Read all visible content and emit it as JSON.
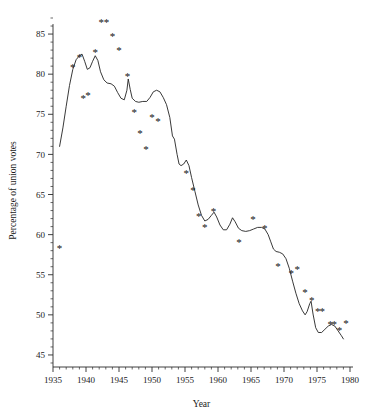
{
  "chart_data": {
    "type": "scatter",
    "title": "",
    "xlabel": "Year",
    "ylabel": "Percentage of union votes",
    "xlim": [
      1935,
      1980
    ],
    "ylim": [
      43.5,
      87.5
    ],
    "grid": false,
    "legend": "none",
    "x_ticks": [
      1935,
      1940,
      1945,
      1950,
      1955,
      1960,
      1965,
      1970,
      1975,
      1980
    ],
    "x_tick_labels": [
      "1935",
      "1940",
      "1945",
      "1950",
      "1955",
      "1960",
      "1965",
      "1970",
      "1975",
      "1980"
    ],
    "x_minor_step": 1,
    "y_ticks": [
      45,
      50,
      55,
      60,
      65,
      70,
      75,
      80,
      85
    ],
    "y_tick_labels": [
      "45",
      "50",
      "55",
      "60",
      "65",
      "70",
      "75",
      "80",
      "85"
    ],
    "y_minor_step": 1,
    "marker_symbol": "*",
    "series": [
      {
        "name": "observed",
        "type": "scatter",
        "marker": "*",
        "points": [
          [
            1936,
            58.2
          ],
          [
            1938,
            80.8
          ],
          [
            1939,
            82.0
          ],
          [
            1939.6,
            76.9
          ],
          [
            1940.3,
            77.3
          ],
          [
            1941.4,
            82.6
          ],
          [
            1942.3,
            86.4
          ],
          [
            1943.1,
            86.4
          ],
          [
            1944.0,
            84.6
          ],
          [
            1945.0,
            82.9
          ],
          [
            1946.3,
            79.6
          ],
          [
            1947.3,
            75.2
          ],
          [
            1948.2,
            72.5
          ],
          [
            1949.1,
            70.5
          ],
          [
            1950.0,
            74.5
          ],
          [
            1950.9,
            74.1
          ],
          [
            1955.2,
            67.6
          ],
          [
            1956.2,
            65.4
          ],
          [
            1957.1,
            62.2
          ],
          [
            1958.0,
            60.8
          ],
          [
            1959.3,
            62.8
          ],
          [
            1963.2,
            59.0
          ],
          [
            1965.3,
            61.8
          ],
          [
            1967.1,
            60.7
          ],
          [
            1969.1,
            56.0
          ],
          [
            1971.1,
            55.1
          ],
          [
            1972.0,
            55.6
          ],
          [
            1973.2,
            52.7
          ],
          [
            1974.2,
            51.7
          ],
          [
            1975.1,
            50.4
          ],
          [
            1975.8,
            50.4
          ],
          [
            1977.0,
            48.8
          ],
          [
            1977.6,
            48.8
          ],
          [
            1978.4,
            48.0
          ],
          [
            1979.4,
            48.9
          ]
        ]
      },
      {
        "name": "smoothed-trend",
        "type": "line",
        "points": [
          [
            1936.0,
            71.0
          ],
          [
            1936.5,
            73.3
          ],
          [
            1937.0,
            76.0
          ],
          [
            1937.5,
            78.6
          ],
          [
            1938.0,
            80.6
          ],
          [
            1938.5,
            81.8
          ],
          [
            1939.0,
            82.3
          ],
          [
            1939.4,
            82.5
          ],
          [
            1939.8,
            81.6
          ],
          [
            1940.2,
            80.6
          ],
          [
            1940.6,
            80.8
          ],
          [
            1941.0,
            81.6
          ],
          [
            1941.4,
            82.3
          ],
          [
            1941.8,
            81.7
          ],
          [
            1942.2,
            80.3
          ],
          [
            1942.7,
            79.3
          ],
          [
            1943.2,
            78.9
          ],
          [
            1943.8,
            78.8
          ],
          [
            1944.3,
            78.5
          ],
          [
            1944.8,
            77.7
          ],
          [
            1945.3,
            77.0
          ],
          [
            1945.8,
            76.8
          ],
          [
            1946.2,
            78.0
          ],
          [
            1946.4,
            79.4
          ],
          [
            1946.7,
            78.1
          ],
          [
            1947.0,
            77.0
          ],
          [
            1947.5,
            76.6
          ],
          [
            1948.0,
            76.5
          ],
          [
            1948.6,
            76.6
          ],
          [
            1949.2,
            76.6
          ],
          [
            1949.7,
            77.1
          ],
          [
            1950.2,
            77.8
          ],
          [
            1950.7,
            78.0
          ],
          [
            1951.2,
            77.8
          ],
          [
            1951.7,
            77.1
          ],
          [
            1952.2,
            76.2
          ],
          [
            1952.7,
            74.6
          ],
          [
            1953.1,
            72.3
          ],
          [
            1953.4,
            71.9
          ],
          [
            1953.8,
            70.0
          ],
          [
            1954.1,
            68.8
          ],
          [
            1954.4,
            68.6
          ],
          [
            1954.8,
            68.8
          ],
          [
            1955.2,
            69.3
          ],
          [
            1955.6,
            68.6
          ],
          [
            1956.0,
            67.1
          ],
          [
            1956.5,
            65.4
          ],
          [
            1957.0,
            63.7
          ],
          [
            1957.5,
            62.4
          ],
          [
            1958.0,
            61.7
          ],
          [
            1958.5,
            61.9
          ],
          [
            1959.0,
            62.4
          ],
          [
            1959.4,
            62.8
          ],
          [
            1959.8,
            62.2
          ],
          [
            1960.3,
            61.2
          ],
          [
            1960.8,
            60.6
          ],
          [
            1961.3,
            60.6
          ],
          [
            1961.8,
            61.3
          ],
          [
            1962.2,
            62.1
          ],
          [
            1962.6,
            61.6
          ],
          [
            1963.1,
            60.8
          ],
          [
            1963.6,
            60.5
          ],
          [
            1964.2,
            60.4
          ],
          [
            1964.8,
            60.5
          ],
          [
            1965.4,
            60.7
          ],
          [
            1966.0,
            60.9
          ],
          [
            1966.6,
            60.9
          ],
          [
            1967.1,
            60.7
          ],
          [
            1967.6,
            60.0
          ],
          [
            1968.0,
            59.1
          ],
          [
            1968.4,
            58.2
          ],
          [
            1968.8,
            57.9
          ],
          [
            1969.3,
            57.8
          ],
          [
            1969.8,
            57.6
          ],
          [
            1970.3,
            57.0
          ],
          [
            1970.8,
            55.8
          ],
          [
            1971.3,
            54.2
          ],
          [
            1971.8,
            52.7
          ],
          [
            1972.3,
            51.4
          ],
          [
            1972.8,
            50.5
          ],
          [
            1973.2,
            50.0
          ],
          [
            1973.5,
            50.4
          ],
          [
            1973.9,
            51.4
          ],
          [
            1974.1,
            51.7
          ],
          [
            1974.4,
            50.1
          ],
          [
            1974.8,
            48.4
          ],
          [
            1975.2,
            47.8
          ],
          [
            1975.7,
            47.8
          ],
          [
            1976.2,
            48.2
          ],
          [
            1976.7,
            48.6
          ],
          [
            1977.2,
            48.8
          ],
          [
            1977.7,
            48.6
          ],
          [
            1978.2,
            48.0
          ],
          [
            1978.7,
            47.4
          ],
          [
            1979.0,
            47.0
          ]
        ]
      }
    ]
  }
}
